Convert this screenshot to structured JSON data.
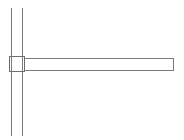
{
  "diagram": {
    "stroke_color": "#7a7a7a",
    "background": "#ffffff",
    "vertical_post": {
      "left_line": {
        "x": 11.5,
        "y1": 8,
        "y2": 136
      },
      "right_line": {
        "x": 22.5,
        "y1": 8,
        "y2": 136
      }
    },
    "joint_box": {
      "x": 9.5,
      "y": 56.5,
      "width": 15,
      "height": 15
    },
    "horizontal_beam": {
      "x": 24.5,
      "y": 58.5,
      "width": 149,
      "height": 12
    }
  }
}
